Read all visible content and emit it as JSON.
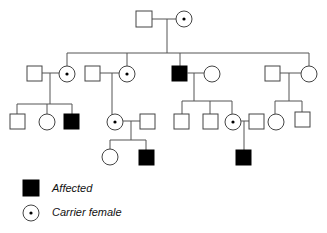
{
  "legend": {
    "affected_label": "Affected",
    "carrier_label": "Carrier female"
  },
  "colors": {
    "affected": "#000000",
    "line": "#555555",
    "background": "#ffffff"
  },
  "pedigree": {
    "generations": [
      {
        "gen": "I",
        "individuals": [
          {
            "id": "I-1",
            "sex": "male",
            "status": "unaffected"
          },
          {
            "id": "I-2",
            "sex": "female",
            "status": "carrier"
          }
        ]
      },
      {
        "gen": "II",
        "individuals": [
          {
            "id": "II-1",
            "sex": "male",
            "status": "unaffected",
            "role": "spouse"
          },
          {
            "id": "II-2",
            "sex": "female",
            "status": "carrier"
          },
          {
            "id": "II-3",
            "sex": "male",
            "status": "unaffected",
            "role": "spouse"
          },
          {
            "id": "II-4",
            "sex": "female",
            "status": "carrier"
          },
          {
            "id": "II-5",
            "sex": "male",
            "status": "affected"
          },
          {
            "id": "II-6",
            "sex": "female",
            "status": "unaffected",
            "role": "spouse"
          },
          {
            "id": "II-7",
            "sex": "male",
            "status": "unaffected",
            "role": "spouse"
          },
          {
            "id": "II-8",
            "sex": "female",
            "status": "unaffected"
          }
        ]
      },
      {
        "gen": "III",
        "individuals": [
          {
            "id": "III-1",
            "sex": "male",
            "status": "unaffected"
          },
          {
            "id": "III-2",
            "sex": "female",
            "status": "unaffected"
          },
          {
            "id": "III-3",
            "sex": "male",
            "status": "affected"
          },
          {
            "id": "III-4",
            "sex": "female",
            "status": "carrier"
          },
          {
            "id": "III-5",
            "sex": "male",
            "status": "unaffected",
            "role": "spouse"
          },
          {
            "id": "III-6",
            "sex": "male",
            "status": "unaffected"
          },
          {
            "id": "III-7",
            "sex": "male",
            "status": "unaffected"
          },
          {
            "id": "III-8",
            "sex": "female",
            "status": "carrier"
          },
          {
            "id": "III-9",
            "sex": "male",
            "status": "unaffected",
            "role": "spouse"
          },
          {
            "id": "III-10",
            "sex": "female",
            "status": "unaffected"
          },
          {
            "id": "III-11",
            "sex": "male",
            "status": "unaffected"
          }
        ]
      },
      {
        "gen": "IV",
        "individuals": [
          {
            "id": "IV-1",
            "sex": "female",
            "status": "unaffected"
          },
          {
            "id": "IV-2",
            "sex": "male",
            "status": "affected"
          },
          {
            "id": "IV-3",
            "sex": "male",
            "status": "affected"
          }
        ]
      }
    ]
  }
}
